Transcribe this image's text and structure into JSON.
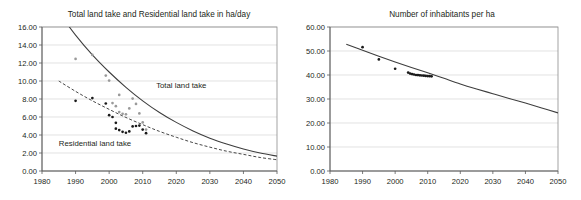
{
  "figure": {
    "background": "#ffffff",
    "panels": [
      "left",
      "right"
    ]
  },
  "chart_data": [
    {
      "id": "land-take",
      "type": "scatter",
      "title": "Total land take and Residential land take in ha/day",
      "xlabel": "",
      "ylabel": "",
      "xlim": [
        1980,
        2050
      ],
      "ylim": [
        0,
        16
      ],
      "xticks": [
        1980,
        1990,
        2000,
        2010,
        2020,
        2030,
        2040,
        2050
      ],
      "xtick_labels": [
        "1980",
        "1990",
        "2000",
        "2010",
        "2020",
        "2030",
        "2040",
        "2050"
      ],
      "yticks": [
        0,
        2,
        4,
        6,
        8,
        10,
        12,
        14,
        16
      ],
      "ytick_labels": [
        "0.00",
        "2.00",
        "4.00",
        "6.00",
        "8.00",
        "10.00",
        "12.00",
        "14.00",
        "16.00"
      ],
      "grid": "horizontal",
      "legend": "inline-annotations",
      "annotations": [
        {
          "text": "Total land take",
          "x": 2014,
          "y": 9.2,
          "color": "#231f20"
        },
        {
          "text": "Residential land take",
          "x": 1985,
          "y": 2.75,
          "color": "#231f20"
        }
      ],
      "series": [
        {
          "name": "Total land take",
          "style": "solid-curve",
          "color": "#3d3d3d",
          "marker_color": "#9a9a9a",
          "curve": [
            [
              1985,
              17.6
            ],
            [
              1990,
              15.1
            ],
            [
              1995,
              12.9
            ],
            [
              2000,
              11.0
            ],
            [
              2005,
              9.3
            ],
            [
              2010,
              7.8
            ],
            [
              2015,
              6.5
            ],
            [
              2020,
              5.4
            ],
            [
              2025,
              4.45
            ],
            [
              2030,
              3.65
            ],
            [
              2035,
              3.0
            ],
            [
              2040,
              2.45
            ],
            [
              2045,
              2.0
            ],
            [
              2050,
              1.65
            ]
          ],
          "points": [
            [
              1990,
              12.45
            ],
            [
              1995,
              12.9
            ],
            [
              1999,
              10.6
            ],
            [
              2000,
              10.05
            ],
            [
              2001,
              7.55
            ],
            [
              2002,
              7.2
            ],
            [
              2003,
              8.45
            ],
            [
              2003,
              6.55
            ],
            [
              2004,
              6.35
            ],
            [
              2005,
              6.3
            ],
            [
              2006,
              6.95
            ],
            [
              2007,
              8.05
            ],
            [
              2008,
              7.45
            ],
            [
              2009,
              6.4
            ],
            [
              2010,
              5.4
            ],
            [
              2011,
              4.6
            ]
          ]
        },
        {
          "name": "Residential land take",
          "style": "dashed-curve",
          "color": "#3d3d3d",
          "marker_color": "#1a1a1a",
          "curve": [
            [
              1985,
              10.0
            ],
            [
              1990,
              8.85
            ],
            [
              1995,
              7.8
            ],
            [
              2000,
              6.85
            ],
            [
              2005,
              5.95
            ],
            [
              2010,
              5.15
            ],
            [
              2015,
              4.4
            ],
            [
              2020,
              3.75
            ],
            [
              2025,
              3.15
            ],
            [
              2030,
              2.65
            ],
            [
              2035,
              2.2
            ],
            [
              2040,
              1.85
            ],
            [
              2045,
              1.5
            ],
            [
              2050,
              1.25
            ]
          ],
          "points": [
            [
              1990,
              7.8
            ],
            [
              1995,
              8.1
            ],
            [
              1999,
              7.5
            ],
            [
              2000,
              6.2
            ],
            [
              2001,
              6.0
            ],
            [
              2002,
              5.35
            ],
            [
              2002,
              4.7
            ],
            [
              2003,
              4.55
            ],
            [
              2004,
              4.35
            ],
            [
              2005,
              4.25
            ],
            [
              2006,
              4.4
            ],
            [
              2007,
              4.95
            ],
            [
              2008,
              5.0
            ],
            [
              2009,
              5.05
            ],
            [
              2010,
              4.6
            ],
            [
              2011,
              4.2
            ]
          ]
        }
      ]
    },
    {
      "id": "inhabitants",
      "type": "scatter",
      "title": "Number of inhabitants per ha",
      "xlabel": "",
      "ylabel": "",
      "xlim": [
        1980,
        2050
      ],
      "ylim": [
        0,
        60
      ],
      "xticks": [
        1980,
        1990,
        2000,
        2010,
        2020,
        2030,
        2040,
        2050
      ],
      "xtick_labels": [
        "1980",
        "1990",
        "2000",
        "2010",
        "2020",
        "2030",
        "2040",
        "2050"
      ],
      "yticks": [
        0,
        10,
        20,
        30,
        40,
        50,
        60
      ],
      "ytick_labels": [
        "0.00",
        "10.00",
        "20.00",
        "30.00",
        "40.00",
        "50.00",
        "60.00"
      ],
      "grid": "horizontal",
      "legend": "none",
      "annotations": [],
      "series": [
        {
          "name": "Number of inhabitants per ha",
          "style": "solid-curve",
          "color": "#3d3d3d",
          "marker_color": "#1a1a1a",
          "curve": [
            [
              1985,
              52.8
            ],
            [
              1990,
              50.3
            ],
            [
              1995,
              47.8
            ],
            [
              2000,
              45.4
            ],
            [
              2005,
              43.1
            ],
            [
              2010,
              40.9
            ],
            [
              2015,
              38.6
            ],
            [
              2020,
              36.3
            ],
            [
              2025,
              34.2
            ],
            [
              2030,
              32.2
            ],
            [
              2035,
              30.2
            ],
            [
              2040,
              28.3
            ],
            [
              2045,
              26.3
            ],
            [
              2050,
              24.2
            ]
          ],
          "points": [
            [
              1990,
              51.6
            ],
            [
              1995,
              46.5
            ],
            [
              2000,
              42.6
            ],
            [
              2004,
              41.0
            ],
            [
              2004.6,
              40.6
            ],
            [
              2005.2,
              40.4
            ],
            [
              2005.8,
              40.2
            ],
            [
              2006.4,
              40.0
            ],
            [
              2007,
              39.95
            ],
            [
              2007.6,
              39.85
            ],
            [
              2008.2,
              39.8
            ],
            [
              2008.8,
              39.7
            ],
            [
              2009.4,
              39.6
            ],
            [
              2010,
              39.55
            ],
            [
              2010.6,
              39.5
            ],
            [
              2011.2,
              39.45
            ]
          ]
        }
      ]
    }
  ]
}
